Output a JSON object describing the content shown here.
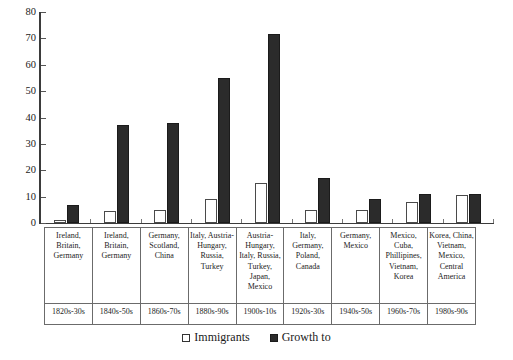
{
  "chart_data": {
    "type": "bar",
    "title": "",
    "xlabel": "",
    "ylabel": "",
    "ylim": [
      0,
      80
    ],
    "yticks": [
      0,
      10,
      20,
      30,
      40,
      50,
      60,
      70,
      80
    ],
    "grid": false,
    "legend_position": "bottom",
    "categories": [
      "1820s-30s",
      "1840s-50s",
      "1860s-70s",
      "1880s-90s",
      "1900s-10s",
      "1920s-30s",
      "1940s-50s",
      "1960s-70s",
      "1980s-90s"
    ],
    "series": [
      {
        "name": "Immigrants",
        "values": [
          1,
          4.5,
          5,
          9,
          15,
          5,
          5,
          8,
          10.5
        ]
      },
      {
        "name": "Growth to",
        "values": [
          7,
          37,
          38,
          55,
          71.5,
          17,
          9,
          11,
          11
        ]
      }
    ],
    "origins": [
      "Ireland, Britain, Germany",
      "Ireland, Britain, Germany",
      "Germany, Scotland, China",
      "Italy, Austria-Hungary, Russia, Turkey",
      "Austria-Hungary, Italy, Russia, Turkey, Japan, Mexico",
      "Italy, Germany, Poland, Canada",
      "Germany, Mexico",
      "Mexico, Cuba, Phillipines, Vietnam, Korea",
      "Korea, China, Vietnam, Mexico, Central America"
    ]
  },
  "colors": {
    "immigrants": "#ffffff",
    "growth": "#2b2b2b",
    "axis": "#3b3b3b",
    "text": "#1a1a1a"
  },
  "legend": {
    "items": [
      {
        "label": "Immigrants",
        "swatch": "light-square-icon"
      },
      {
        "label": "Growth to",
        "swatch": "dark-square-icon"
      }
    ]
  }
}
